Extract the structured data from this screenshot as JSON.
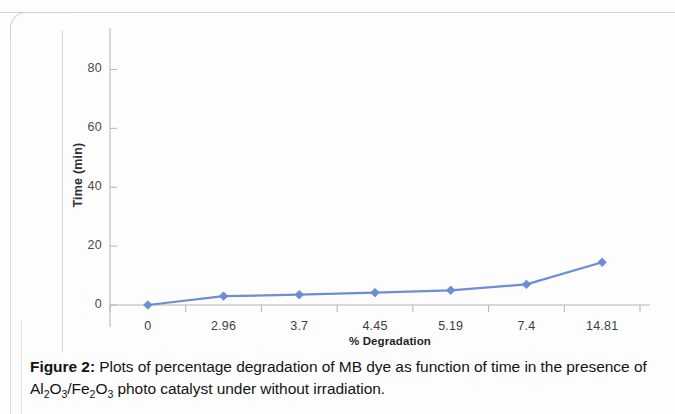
{
  "figure": {
    "label": "Figure 2:",
    "caption_part_1": " Plots of percentage degradation of MB dye as function of time in the presence of Al",
    "caption_sub_1": "2",
    "caption_part_2": "O",
    "caption_sub_2": "3",
    "caption_part_3": "/Fe",
    "caption_sub_3": "2",
    "caption_part_4": "O",
    "caption_sub_4": "3",
    "caption_part_5": " photo catalyst under without irradiation."
  },
  "chart_data": {
    "type": "line",
    "title": "",
    "subtitle": "",
    "xlabel": "% Degradation",
    "ylabel": "Time (min)",
    "categories": [
      "0",
      "2.96",
      "3.7",
      "4.45",
      "5.19",
      "7.4",
      "14.81"
    ],
    "series": [
      {
        "name": "Time (min)",
        "values": [
          0,
          3,
          3.5,
          4.2,
          5,
          7,
          14.5
        ],
        "color": "#6C8ED4",
        "marker": "diamond",
        "marker_color": "#6C8ED4"
      }
    ],
    "ylim": [
      0,
      90
    ],
    "yticks": [
      0,
      20,
      40,
      60,
      80
    ],
    "ytick_labels": [
      "0",
      "20",
      "40",
      "60",
      "80"
    ],
    "grid": false,
    "legend": false,
    "legend_position": "none",
    "axis_color": "#b4b4b4",
    "category_axis": true
  }
}
